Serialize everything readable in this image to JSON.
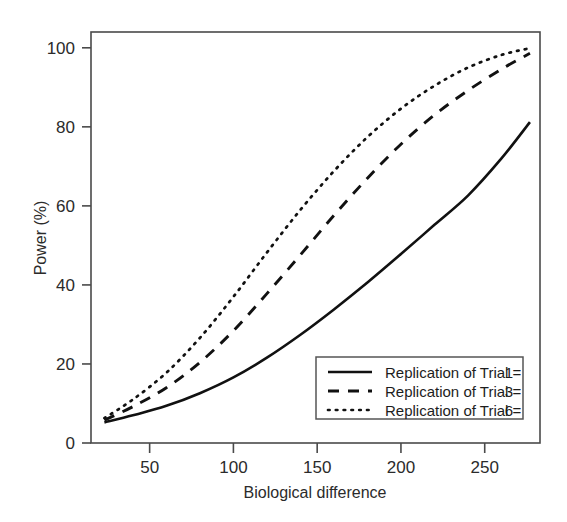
{
  "chart_data": {
    "type": "line",
    "title": "",
    "xlabel": "Biological difference",
    "ylabel": "Power (%)",
    "xlim": [
      15,
      283
    ],
    "ylim": [
      0,
      104
    ],
    "xticks": [
      50,
      100,
      150,
      200,
      250
    ],
    "xtick_labels": [
      "50",
      "100",
      "150",
      "200",
      "250"
    ],
    "yticks": [
      0,
      20,
      40,
      60,
      80,
      100
    ],
    "ytick_labels": [
      "0",
      "20",
      "40",
      "60",
      "80",
      "100"
    ],
    "grid": false,
    "legend_position": "bottom-right",
    "x": [
      23,
      40,
      60,
      80,
      100,
      120,
      140,
      160,
      180,
      200,
      220,
      240,
      260,
      277
    ],
    "series": [
      {
        "name": "Replication of  Trial = 1",
        "label_prefix": "Replication of  Trial =",
        "value_label": "1",
        "style": "solid",
        "color": "#111111",
        "values": [
          5.2,
          7.0,
          9.4,
          12.6,
          16.6,
          21.6,
          27.4,
          33.8,
          40.6,
          47.8,
          55.2,
          62.6,
          72.0,
          81.2
        ]
      },
      {
        "name": "Replication of  Trial = 3",
        "label_prefix": "Replication of  Trial =",
        "value_label": "3",
        "style": "dashed",
        "color": "#111111",
        "values": [
          5.8,
          9.2,
          14.0,
          20.4,
          28.4,
          37.8,
          47.6,
          57.6,
          67.0,
          75.6,
          83.0,
          89.2,
          94.6,
          98.6
        ]
      },
      {
        "name": "Replication of  Trial = 6",
        "label_prefix": "Replication of  Trial =",
        "value_label": "6",
        "style": "dotted",
        "color": "#111111",
        "values": [
          6.3,
          11.0,
          17.8,
          26.6,
          37.0,
          48.2,
          59.0,
          68.8,
          77.4,
          84.6,
          90.4,
          95.0,
          98.2,
          99.9
        ]
      }
    ]
  },
  "legend": {
    "entries": [
      {
        "label": "Replication of  Trial =",
        "value": "1",
        "style": "solid"
      },
      {
        "label": "Replication of  Trial =",
        "value": "3",
        "style": "dashed"
      },
      {
        "label": "Replication of  Trial =",
        "value": "6",
        "style": "dotted"
      }
    ]
  }
}
